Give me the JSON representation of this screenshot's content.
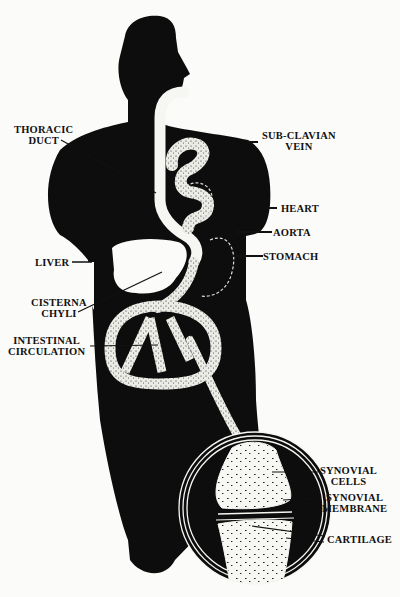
{
  "diagram": {
    "type": "anatomical-illustration",
    "colors": {
      "silhouette": "#0d0d0d",
      "background": "#fbfbf9",
      "stippled": "#e8e8e2",
      "duct": "#f6f6f2"
    },
    "labels": {
      "thoracic_duct": {
        "line1": "THORACIC",
        "line2": "DUCT"
      },
      "sub_clavian_vein": {
        "line1": "SUB-CLAVIAN",
        "line2": "VEIN"
      },
      "heart": "HEART",
      "aorta": "AORTA",
      "liver": "LIVER",
      "stomach": "STOMACH",
      "cisterna_chyli": {
        "line1": "CISTERNA",
        "line2": "CHYLI"
      },
      "intestinal_circulation": {
        "line1": "INTESTINAL",
        "line2": "CIRCULATION"
      },
      "synovial_cells": {
        "line1": "SYNOVIAL",
        "line2": "CELLS"
      },
      "synovial_membrane": {
        "line1": "SYNOVIAL",
        "line2": "MEMBRANE"
      },
      "cartilage": "CARTILAGE"
    }
  }
}
